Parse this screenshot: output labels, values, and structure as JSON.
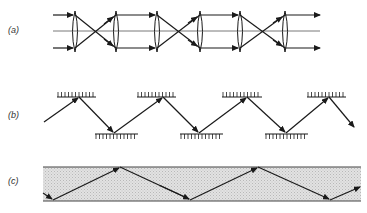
{
  "figure": {
    "panels": [
      {
        "id": "a",
        "label": "(a)",
        "description": "Lens waveguide: sequence of converging lenses periodically refocusing a parallel beam"
      },
      {
        "id": "b",
        "label": "(b)",
        "description": "Mirror waveguide: ray zigzagging between offset plane mirrors"
      },
      {
        "id": "c",
        "label": "(c)",
        "description": "Dielectric slab waveguide: ray propagating by total internal reflection"
      }
    ]
  },
  "colors": {
    "stroke": "#1a1a1a",
    "axis": "#555555",
    "slab_fill": "#d9d9d9",
    "slab_border": "#444444",
    "background": "#ffffff"
  }
}
